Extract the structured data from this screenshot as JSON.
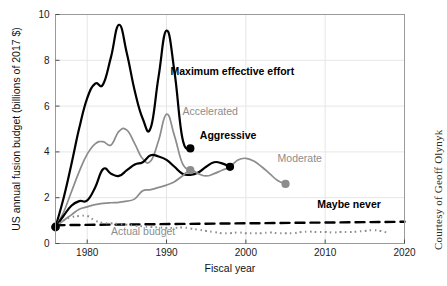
{
  "figure": {
    "credit": "Courtesy of Geoff Olynyk",
    "background_color": "#ffffff"
  },
  "colors": {
    "dark_series": "#000000",
    "gray_series": "#8c8c8c",
    "axis": "#4d4d4d",
    "gridline": "#e6e6e6",
    "frame": "#9a9a9a"
  },
  "chart_data": {
    "type": "line",
    "title": "",
    "subtitle": "",
    "xlabel": "Fiscal year",
    "ylabel": "US annual fusion budget (billions of 2017 $)",
    "xlim": [
      1976,
      2020
    ],
    "ylim": [
      0,
      10
    ],
    "xticks": [
      1980,
      1990,
      2000,
      2010,
      2020
    ],
    "xtick_labels": [
      "1980",
      "1990",
      "2000",
      "2010",
      "2020"
    ],
    "yticks": [
      0,
      2,
      4,
      6,
      8,
      10
    ],
    "ytick_labels": [
      "0",
      "2",
      "4",
      "6",
      "8",
      "10"
    ],
    "grid": true,
    "legend_position": "inline-annotations",
    "annotations": [
      {
        "text": "Maximum effective effort",
        "x": 1990.5,
        "y": 7.35,
        "style": "dark"
      },
      {
        "text": "Accelerated",
        "x": 1992.0,
        "y": 5.62,
        "style": "gray"
      },
      {
        "text": "Aggressive",
        "x": 1994.2,
        "y": 4.55,
        "style": "dark"
      },
      {
        "text": "Moderate",
        "x": 2004.0,
        "y": 3.55,
        "style": "gray"
      },
      {
        "text": "Maybe never",
        "x": 2009.0,
        "y": 1.55,
        "style": "dark"
      },
      {
        "text": "Actual budget",
        "x": 1983.0,
        "y": 0.38,
        "style": "gray"
      }
    ],
    "series": [
      {
        "name": "Maximum effective effort",
        "style": "solid",
        "color": "#000000",
        "width": 2.2,
        "end_marker": true,
        "end_marker_color": "#000000",
        "points": [
          [
            1976,
            0.72
          ],
          [
            1977,
            1.95
          ],
          [
            1978,
            3.45
          ],
          [
            1979,
            5.05
          ],
          [
            1980,
            6.35
          ],
          [
            1981,
            6.98
          ],
          [
            1982,
            6.95
          ],
          [
            1983,
            8.15
          ],
          [
            1984,
            9.55
          ],
          [
            1985,
            8.3
          ],
          [
            1986,
            6.65
          ],
          [
            1987,
            5.45
          ],
          [
            1988,
            5.05
          ],
          [
            1989,
            7.3
          ],
          [
            1990,
            9.3
          ],
          [
            1991,
            7.5
          ],
          [
            1992,
            4.6
          ],
          [
            1993,
            4.15
          ]
        ]
      },
      {
        "name": "Accelerated",
        "style": "solid",
        "color": "#8c8c8c",
        "width": 1.7,
        "end_marker": true,
        "end_marker_color": "#8c8c8c",
        "points": [
          [
            1976,
            0.72
          ],
          [
            1977,
            1.35
          ],
          [
            1978,
            2.25
          ],
          [
            1979,
            3.15
          ],
          [
            1980,
            3.9
          ],
          [
            1981,
            4.35
          ],
          [
            1982,
            4.45
          ],
          [
            1983,
            4.3
          ],
          [
            1984,
            4.9
          ],
          [
            1985,
            4.95
          ],
          [
            1986,
            4.35
          ],
          [
            1987,
            3.7
          ],
          [
            1988,
            3.6
          ],
          [
            1989,
            4.5
          ],
          [
            1990,
            5.65
          ],
          [
            1991,
            4.7
          ],
          [
            1992,
            3.5
          ],
          [
            1993,
            3.2
          ]
        ]
      },
      {
        "name": "Aggressive",
        "style": "solid",
        "color": "#000000",
        "width": 2.2,
        "end_marker": true,
        "end_marker_color": "#000000",
        "points": [
          [
            1976,
            0.72
          ],
          [
            1977,
            1.2
          ],
          [
            1978,
            1.65
          ],
          [
            1979,
            1.85
          ],
          [
            1980,
            1.88
          ],
          [
            1981,
            2.45
          ],
          [
            1982,
            3.25
          ],
          [
            1983,
            3.05
          ],
          [
            1984,
            2.95
          ],
          [
            1985,
            3.2
          ],
          [
            1986,
            3.45
          ],
          [
            1987,
            3.55
          ],
          [
            1988,
            3.85
          ],
          [
            1989,
            3.8
          ],
          [
            1990,
            3.65
          ],
          [
            1991,
            3.35
          ],
          [
            1992,
            3.05
          ],
          [
            1993,
            3.0
          ],
          [
            1994,
            3.1
          ],
          [
            1995,
            3.35
          ],
          [
            1996,
            3.55
          ],
          [
            1997,
            3.5
          ],
          [
            1998,
            3.35
          ]
        ]
      },
      {
        "name": "Moderate",
        "style": "solid",
        "color": "#8c8c8c",
        "width": 1.7,
        "end_marker": true,
        "end_marker_color": "#8c8c8c",
        "points": [
          [
            1976,
            0.72
          ],
          [
            1977,
            1.0
          ],
          [
            1978,
            1.25
          ],
          [
            1979,
            1.5
          ],
          [
            1980,
            1.6
          ],
          [
            1981,
            1.7
          ],
          [
            1982,
            1.75
          ],
          [
            1983,
            1.78
          ],
          [
            1984,
            1.8
          ],
          [
            1985,
            1.85
          ],
          [
            1986,
            1.95
          ],
          [
            1987,
            2.3
          ],
          [
            1988,
            2.35
          ],
          [
            1989,
            2.45
          ],
          [
            1990,
            2.55
          ],
          [
            1991,
            2.7
          ],
          [
            1992,
            2.95
          ],
          [
            1993,
            3.2
          ],
          [
            1994,
            3.05
          ],
          [
            1995,
            2.95
          ],
          [
            1996,
            3.05
          ],
          [
            1997,
            3.2
          ],
          [
            1998,
            3.35
          ],
          [
            1999,
            3.65
          ],
          [
            2000,
            3.72
          ],
          [
            2001,
            3.6
          ],
          [
            2002,
            3.35
          ],
          [
            2003,
            3.05
          ],
          [
            2004,
            2.75
          ],
          [
            2005,
            2.6
          ]
        ]
      },
      {
        "name": "Maybe never",
        "style": "dashed",
        "color": "#000000",
        "width": 2.4,
        "end_marker": false,
        "points": [
          [
            1976,
            0.8
          ],
          [
            2020,
            0.95
          ]
        ]
      },
      {
        "name": "Actual budget",
        "style": "dotted",
        "color": "#8c8c8c",
        "width": 2.0,
        "end_marker": false,
        "points": [
          [
            1976,
            0.72
          ],
          [
            1977,
            1.0
          ],
          [
            1978,
            1.15
          ],
          [
            1979,
            1.2
          ],
          [
            1980,
            1.2
          ],
          [
            1981,
            1.0
          ],
          [
            1982,
            0.9
          ],
          [
            1983,
            0.88
          ],
          [
            1984,
            0.85
          ],
          [
            1985,
            0.82
          ],
          [
            1986,
            0.78
          ],
          [
            1987,
            0.75
          ],
          [
            1988,
            0.72
          ],
          [
            1989,
            0.7
          ],
          [
            1990,
            0.68
          ],
          [
            1991,
            0.68
          ],
          [
            1992,
            0.7
          ],
          [
            1993,
            0.66
          ],
          [
            1994,
            0.6
          ],
          [
            1995,
            0.55
          ],
          [
            1996,
            0.5
          ],
          [
            1997,
            0.45
          ],
          [
            1998,
            0.45
          ],
          [
            1999,
            0.48
          ],
          [
            2000,
            0.45
          ],
          [
            2001,
            0.45
          ],
          [
            2002,
            0.45
          ],
          [
            2003,
            0.48
          ],
          [
            2004,
            0.45
          ],
          [
            2005,
            0.45
          ],
          [
            2006,
            0.45
          ],
          [
            2007,
            0.5
          ],
          [
            2008,
            0.52
          ],
          [
            2009,
            0.5
          ],
          [
            2010,
            0.5
          ],
          [
            2011,
            0.48
          ],
          [
            2012,
            0.5
          ],
          [
            2013,
            0.5
          ],
          [
            2014,
            0.52
          ],
          [
            2015,
            0.55
          ],
          [
            2016,
            0.58
          ],
          [
            2017,
            0.55
          ],
          [
            2018,
            0.45
          ]
        ]
      }
    ],
    "origin_marker": {
      "x": 1976,
      "y": 0.72,
      "color": "#000000"
    }
  }
}
